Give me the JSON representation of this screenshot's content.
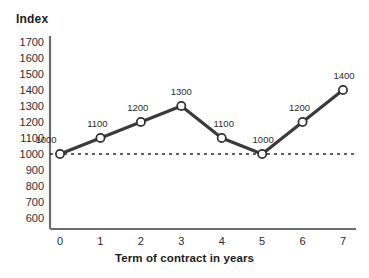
{
  "chart_data": {
    "type": "line",
    "title": "",
    "ylabel": "Index",
    "xlabel": "Term of contract in years",
    "x": [
      0,
      1,
      2,
      3,
      4,
      5,
      6,
      7
    ],
    "values": [
      1000,
      1100,
      1200,
      1300,
      1100,
      1000,
      1200,
      1400
    ],
    "point_labels": [
      "1000",
      "1100",
      "1200",
      "1300",
      "1100",
      "1000",
      "1200",
      "1400"
    ],
    "xticklabels": [
      "0",
      "1",
      "2",
      "3",
      "4",
      "5",
      "6",
      "7"
    ],
    "yticklabels": [
      "1700",
      "1600",
      "1500",
      "1400",
      "1300",
      "1200",
      "1100",
      "1000",
      "900",
      "800",
      "700",
      "600"
    ],
    "ytickvalues": [
      1700,
      1600,
      1500,
      1400,
      1300,
      1200,
      1100,
      1000,
      900,
      800,
      700,
      600
    ],
    "ylim": [
      600,
      1700
    ],
    "xlim": [
      0,
      7
    ],
    "grid": false,
    "legend": "none",
    "reference_line": {
      "value": 1000,
      "style": "dashed",
      "color": "#2b2b2b"
    },
    "series_style": {
      "line_color": "#3a3a3a",
      "line_width": 3,
      "marker": "circle",
      "marker_fill": "#ffffff",
      "marker_edge": "#2e2e2e"
    },
    "axis_color": "#6e6e6e"
  },
  "colors": {
    "background": "#ffffff",
    "text": "#1c1c1c",
    "line": "#3a3a3a",
    "axis": "#6e6e6e"
  }
}
